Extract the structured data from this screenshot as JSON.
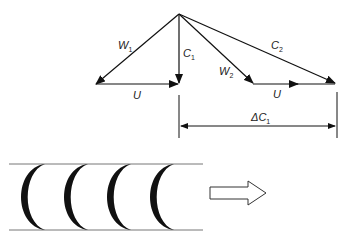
{
  "diagram": {
    "labels": {
      "w1": "W",
      "w1_sub": "1",
      "c1": "C",
      "c1_sub": "1",
      "w2": "W",
      "w2_sub": "2",
      "c2": "C",
      "c2_sub": "2",
      "u_left": "U",
      "u_right": "U",
      "delta_c": "ΔC",
      "delta_c_sub": "1"
    },
    "blade_count": 4,
    "flow_direction": "right"
  }
}
